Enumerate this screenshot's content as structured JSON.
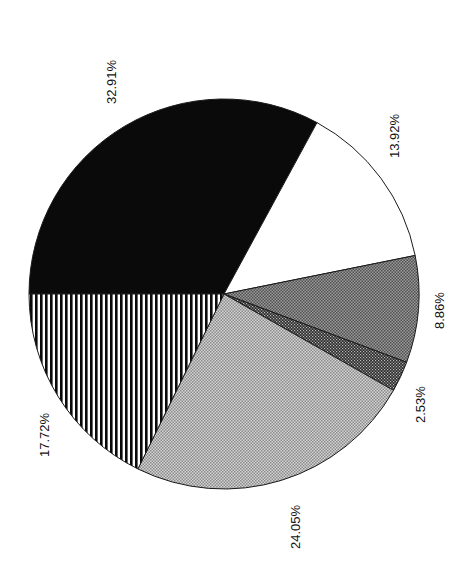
{
  "chart_data": {
    "type": "pie",
    "title": "",
    "rotation_note": "Whole figure rotated -90deg; labels read bottom-to-top",
    "start_angle_deg": 180,
    "direction": "clockwise",
    "categories": [
      "Slice A",
      "Slice B",
      "Slice C",
      "Slice D",
      "Slice E",
      "Slice F"
    ],
    "values": [
      32.91,
      13.92,
      8.86,
      2.53,
      24.05,
      17.72
    ],
    "labels": [
      "32.91%",
      "13.92%",
      "8.86%",
      "2.53%",
      "24.05%",
      "17.72%"
    ],
    "fills": [
      "solid-black",
      "white",
      "dark-gray-dots",
      "dark-crosshatch",
      "light-gray-dots",
      "vertical-stripes"
    ],
    "legend": null,
    "grid": false
  },
  "slices": [
    {
      "label": "32.91%",
      "value": 32.91,
      "pattern": "solid-black"
    },
    {
      "label": "13.92%",
      "value": 13.92,
      "pattern": "white"
    },
    {
      "label": "8.86%",
      "value": 8.86,
      "pattern": "dark-gray-dots"
    },
    {
      "label": "2.53%",
      "value": 2.53,
      "pattern": "dark-crosshatch"
    },
    {
      "label": "24.05%",
      "value": 24.05,
      "pattern": "light-gray-dots"
    },
    {
      "label": "17.72%",
      "value": 17.72,
      "pattern": "vertical-stripes"
    }
  ],
  "colors": {
    "black": "#0a0a0a",
    "white": "#ffffff",
    "outline": "#1a1a1a",
    "dark_gray": "#7a7a7a",
    "light_gray": "#b8b8b8"
  }
}
